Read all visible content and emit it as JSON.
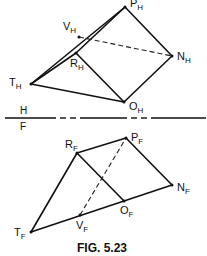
{
  "figure": {
    "caption": "FIG. 5.23",
    "reference_line": {
      "top_label": "H",
      "bottom_label": "F"
    }
  },
  "top_view": {
    "points": [
      {
        "id": "P",
        "main": "P",
        "sub": "H",
        "x": 125,
        "y": 7
      },
      {
        "id": "V",
        "main": "V",
        "sub": "H",
        "x": 79,
        "y": 37
      },
      {
        "id": "R",
        "main": "R",
        "sub": "H",
        "x": 76,
        "y": 53
      },
      {
        "id": "N",
        "main": "N",
        "sub": "H",
        "x": 172,
        "y": 56
      },
      {
        "id": "T",
        "main": "T",
        "sub": "H",
        "x": 31,
        "y": 84
      },
      {
        "id": "O",
        "main": "O",
        "sub": "H",
        "x": 124,
        "y": 102
      }
    ],
    "visible_edges": [
      [
        "T",
        "P"
      ],
      [
        "T",
        "R"
      ],
      [
        "T",
        "O"
      ],
      [
        "R",
        "P"
      ],
      [
        "R",
        "O"
      ],
      [
        "P",
        "N"
      ],
      [
        "N",
        "O"
      ]
    ],
    "hidden_edges": [
      [
        "V",
        "N"
      ]
    ]
  },
  "front_view": {
    "points": [
      {
        "id": "R",
        "main": "R",
        "sub": "F",
        "x": 77,
        "y": 153
      },
      {
        "id": "P",
        "main": "P",
        "sub": "F",
        "x": 126,
        "y": 138
      },
      {
        "id": "N",
        "main": "N",
        "sub": "F",
        "x": 172,
        "y": 185
      },
      {
        "id": "O",
        "main": "O",
        "sub": "F",
        "x": 124,
        "y": 201
      },
      {
        "id": "V",
        "main": "V",
        "sub": "F",
        "x": 80,
        "y": 215
      },
      {
        "id": "T",
        "main": "T",
        "sub": "F",
        "x": 31,
        "y": 232
      }
    ],
    "visible_edges": [
      [
        "T",
        "R"
      ],
      [
        "R",
        "P"
      ],
      [
        "P",
        "N"
      ],
      [
        "T",
        "N"
      ],
      [
        "R",
        "O"
      ]
    ],
    "hidden_edges": [
      [
        "V",
        "P"
      ]
    ]
  }
}
